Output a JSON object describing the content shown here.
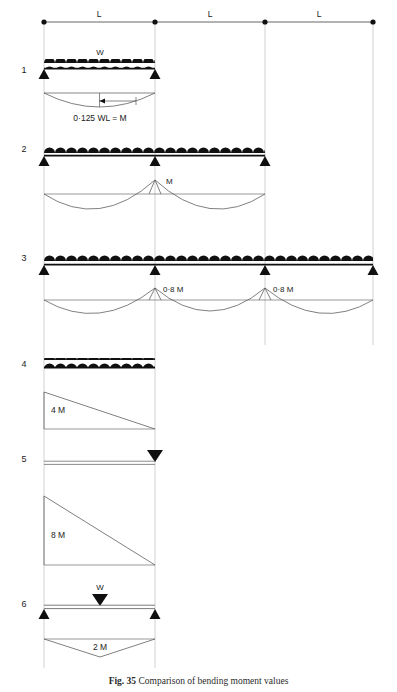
{
  "figure": {
    "caption_label": "Fig. 35",
    "caption_text": "Comparison of bending moment values",
    "caption_full": "Fig. 35  Comparison of bending moment values"
  },
  "dimension_line": {
    "name": "span-dimension-line",
    "spans": [
      {
        "label": "L"
      },
      {
        "label": "L"
      },
      {
        "label": "L"
      }
    ],
    "node_count": 4
  },
  "cases": [
    {
      "number": "1",
      "description": "Single simply supported span, uniformly distributed load",
      "load_label": "W",
      "load_type": "udl",
      "supports": 2,
      "spans": 1,
      "moment_labels": [
        {
          "text": "0·125 WL = M",
          "position": "midspan-sagging"
        }
      ]
    },
    {
      "number": "2",
      "description": "Two continuous spans, uniformly distributed load",
      "load_label": "",
      "load_type": "udl",
      "supports": 3,
      "spans": 2,
      "moment_labels": [
        {
          "text": "M",
          "position": "interior-support-hogging"
        }
      ]
    },
    {
      "number": "3",
      "description": "Three continuous spans, uniformly distributed load",
      "load_label": "",
      "load_type": "udl",
      "supports": 4,
      "spans": 3,
      "moment_labels": [
        {
          "text": "0·8 M",
          "position": "first-interior-support-hogging"
        },
        {
          "text": "0·8 M",
          "position": "second-interior-support-hogging"
        }
      ]
    },
    {
      "number": "4",
      "description": "Cantilever with uniformly distributed load",
      "load_label": "",
      "load_type": "udl",
      "supports": 1,
      "spans": 1,
      "moment_labels": [
        {
          "text": "4 M",
          "position": "fixed-end-hogging"
        }
      ]
    },
    {
      "number": "5",
      "description": "Cantilever with point load at free end",
      "load_label": "",
      "load_type": "point",
      "supports": 1,
      "spans": 1,
      "moment_labels": [
        {
          "text": "8 M",
          "position": "fixed-end-hogging"
        }
      ]
    },
    {
      "number": "6",
      "description": "Simply supported span with central point load",
      "load_label": "W",
      "load_type": "point",
      "supports": 2,
      "spans": 1,
      "moment_labels": [
        {
          "text": "2 M",
          "position": "midspan-sagging"
        }
      ]
    }
  ],
  "colors": {
    "ink": "#1a1a1a",
    "line": "#4a4a4a",
    "grid": "#b9b9b9",
    "load_fill": "#101010",
    "background": "#ffffff"
  }
}
